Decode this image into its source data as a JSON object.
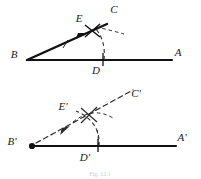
{
  "figure": {
    "caption": "Fig. 12.1",
    "background_color": "#ffffff",
    "ink_color": "#111111",
    "construction_color": "#2b2b2b",
    "top_diagram": {
      "name": "original-angle",
      "description": "Angle ABC with construction arcs meeting at E and D",
      "labels": {
        "vertex_b": "B",
        "point_a": "A",
        "point_c": "C",
        "point_d": "D",
        "point_e": "E"
      },
      "label_positions": {
        "vertex_b": {
          "x": 14,
          "y": 58
        },
        "point_a": {
          "x": 178,
          "y": 56
        },
        "point_c": {
          "x": 114,
          "y": 13
        },
        "point_d": {
          "x": 96,
          "y": 73
        },
        "point_e": {
          "x": 79,
          "y": 21
        },
        "caption_unused": ""
      },
      "geometry": {
        "b": {
          "x": 27,
          "y": 60
        },
        "a": {
          "x": 172,
          "y": 60
        },
        "c": {
          "x": 110,
          "y": 21
        },
        "d": {
          "x": 103,
          "y": 60
        },
        "e": {
          "x": 92,
          "y": 32
        }
      }
    },
    "bottom_diagram": {
      "name": "copied-angle",
      "description": "Angle A'B'C' constructed with dashed arcs meeting at E' and D'",
      "labels": {
        "vertex_b": "B'",
        "point_a": "A'",
        "point_c": "C'",
        "point_d": "D'",
        "point_e": "E'"
      },
      "label_positions": {
        "vertex_b": {
          "x": 10,
          "y": 146
        },
        "point_a": {
          "x": 180,
          "y": 142
        },
        "point_c": {
          "x": 134,
          "y": 97
        },
        "point_d": {
          "x": 84,
          "y": 160
        },
        "point_e": {
          "x": 62,
          "y": 109
        }
      },
      "geometry": {
        "b": {
          "x": 31,
          "y": 146
        },
        "a": {
          "x": 176,
          "y": 146
        },
        "c": {
          "x": 130,
          "y": 92
        },
        "d": {
          "x": 98,
          "y": 146
        },
        "e": {
          "x": 89,
          "y": 115
        }
      }
    }
  }
}
